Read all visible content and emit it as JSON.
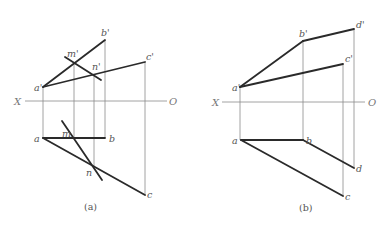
{
  "figure": {
    "panels": [
      {
        "id": "a",
        "caption": "(a)",
        "caption_pos": [
          84,
          210
        ],
        "axis": {
          "x1": 25,
          "x2": 167,
          "y": 101,
          "label_x": "X",
          "label_x_pos": [
            14,
            105
          ],
          "label_o": "O",
          "label_o_pos": [
            169,
            105
          ]
        },
        "projectors": [
          [
            43,
            87,
            43,
            138
          ],
          [
            74,
            63,
            74,
            138
          ],
          [
            94,
            75,
            94,
            167
          ],
          [
            105,
            40,
            105,
            138
          ],
          [
            145,
            62,
            145,
            195
          ]
        ],
        "thick_lines": [
          [
            43,
            87,
            105,
            40
          ],
          [
            43,
            87,
            145,
            62
          ],
          [
            65,
            57,
            101,
            80
          ],
          [
            43,
            138,
            105,
            138
          ],
          [
            43,
            138,
            145,
            195
          ],
          [
            62,
            121,
            102,
            180
          ]
        ],
        "labels": [
          {
            "text": "b'",
            "x": 101,
            "y": 36
          },
          {
            "text": "m'",
            "x": 67,
            "y": 57
          },
          {
            "text": "n'",
            "x": 92,
            "y": 70
          },
          {
            "text": "c'",
            "x": 146,
            "y": 60
          },
          {
            "text": "a'",
            "x": 34,
            "y": 91
          },
          {
            "text": "a",
            "x": 34,
            "y": 142
          },
          {
            "text": "m",
            "x": 62,
            "y": 137
          },
          {
            "text": "b",
            "x": 109,
            "y": 142
          },
          {
            "text": "n",
            "x": 86,
            "y": 176
          },
          {
            "text": "c",
            "x": 147,
            "y": 198
          }
        ]
      },
      {
        "id": "b",
        "caption": "(b)",
        "caption_pos": [
          299,
          211
        ],
        "axis": {
          "x1": 222,
          "x2": 365,
          "y": 102,
          "label_x": "X",
          "label_x_pos": [
            212,
            106
          ],
          "label_o": "O",
          "label_o_pos": [
            368,
            106
          ]
        },
        "projectors": [
          [
            240,
            87,
            240,
            140
          ],
          [
            303,
            41,
            303,
            140
          ],
          [
            343,
            64,
            343,
            196
          ],
          [
            354,
            29,
            354,
            168
          ]
        ],
        "thick_lines": [
          [
            240,
            87,
            303,
            41
          ],
          [
            303,
            41,
            354,
            29
          ],
          [
            240,
            87,
            343,
            64
          ],
          [
            241,
            140,
            303,
            140
          ],
          [
            241,
            140,
            343,
            196
          ],
          [
            303,
            140,
            354,
            168
          ]
        ],
        "labels": [
          {
            "text": "b'",
            "x": 299,
            "y": 37
          },
          {
            "text": "d'",
            "x": 356,
            "y": 28
          },
          {
            "text": "c'",
            "x": 345,
            "y": 62
          },
          {
            "text": "a'",
            "x": 232,
            "y": 91
          },
          {
            "text": "a",
            "x": 232,
            "y": 144
          },
          {
            "text": "b",
            "x": 306,
            "y": 144
          },
          {
            "text": "d",
            "x": 356,
            "y": 172
          },
          {
            "text": "c",
            "x": 345,
            "y": 200
          }
        ]
      }
    ]
  }
}
